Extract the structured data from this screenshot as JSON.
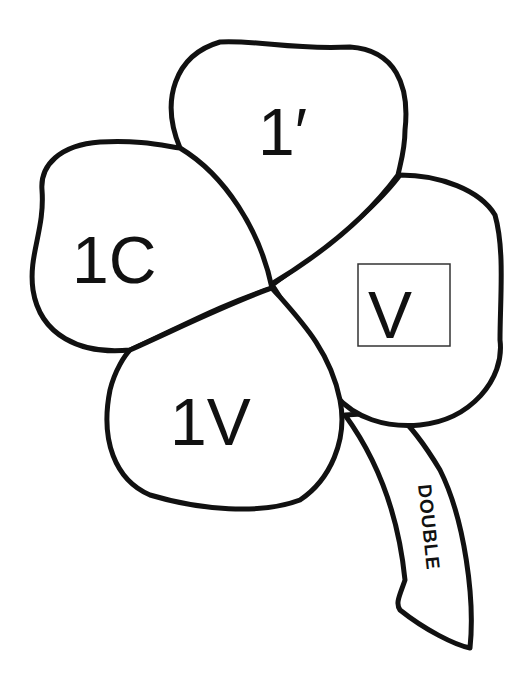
{
  "diagram": {
    "type": "four-leaf clover",
    "leaves": {
      "top": {
        "label": "1′"
      },
      "left": {
        "label": "1C"
      },
      "right": {
        "label": "V",
        "boxed": true
      },
      "bottom": {
        "label": "1V"
      }
    },
    "stem": {
      "label": "DOUBLE"
    }
  },
  "colors": {
    "stroke": "#111111",
    "fill": "#ffffff"
  }
}
